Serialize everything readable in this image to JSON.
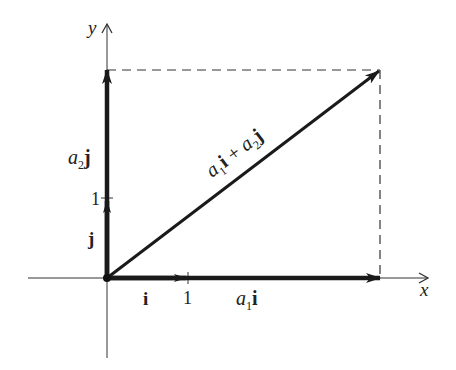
{
  "figure": {
    "type": "vector-decomposition",
    "colors": {
      "ink": "#1a1a1a",
      "axis": "#333333",
      "dash": "#333333",
      "background": "#ffffff"
    },
    "axes": {
      "x_label": "x",
      "y_label": "y",
      "x_tick": "1",
      "y_tick": "1"
    },
    "vectors": {
      "i_label": "i",
      "j_label": "j",
      "a1i": {
        "coef": "a",
        "sub": "1",
        "unit": "i"
      },
      "a2j": {
        "coef": "a",
        "sub": "2",
        "unit": "j"
      },
      "sum": {
        "c1": "a",
        "s1": "1",
        "u1": "i",
        "op": " + ",
        "c2": "a",
        "s2": "2",
        "u2": "j"
      }
    }
  }
}
